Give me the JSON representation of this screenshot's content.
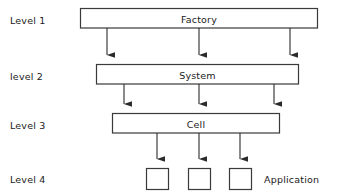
{
  "diagram": {
    "background_color": "#ffffff",
    "line_color": "#3a3a3a",
    "text_color": "#1a1a1a",
    "levels": [
      {
        "label": "Level 1"
      },
      {
        "label": "level 2"
      },
      {
        "label": "Level 3"
      },
      {
        "label": "Level 4"
      }
    ],
    "boxes": [
      {
        "label": "Factory",
        "level": "Level 1",
        "x": 80,
        "y": 8,
        "w": 238,
        "h": 20
      },
      {
        "label": "System",
        "level": "level 2",
        "x": 96,
        "y": 64,
        "w": 203,
        "h": 20
      },
      {
        "label": "Cell",
        "level": "Level 3",
        "x": 112,
        "y": 113,
        "w": 168,
        "h": 20
      },
      {
        "label": "",
        "level": "Level 4",
        "x": 146,
        "y": 168,
        "w": 23,
        "h": 22
      },
      {
        "label": "",
        "level": "Level 4",
        "x": 188,
        "y": 168,
        "w": 23,
        "h": 22
      },
      {
        "label": "",
        "level": "Level 4",
        "x": 229,
        "y": 168,
        "w": 23,
        "h": 22
      }
    ],
    "annotations": [
      {
        "label": "Application",
        "x": 264,
        "y": 174
      }
    ],
    "connections": [
      {
        "from": "Factory",
        "to": "System",
        "x": 107,
        "y1": 28,
        "y2": 64
      },
      {
        "from": "Factory",
        "to": "System",
        "x": 199,
        "y1": 28,
        "y2": 64
      },
      {
        "from": "Factory",
        "to": "System",
        "x": 290,
        "y1": 28,
        "y2": 64
      },
      {
        "from": "System",
        "to": "Cell",
        "x": 124,
        "y1": 84,
        "y2": 113
      },
      {
        "from": "System",
        "to": "Cell",
        "x": 199,
        "y1": 84,
        "y2": 113
      },
      {
        "from": "System",
        "to": "Cell",
        "x": 274,
        "y1": 84,
        "y2": 113
      },
      {
        "from": "Cell",
        "to": "Application",
        "x": 157,
        "y1": 133,
        "y2": 168
      },
      {
        "from": "Cell",
        "to": "Application",
        "x": 199,
        "y1": 133,
        "y2": 168
      },
      {
        "from": "Cell",
        "to": "Application",
        "x": 240,
        "y1": 133,
        "y2": 168
      }
    ]
  }
}
